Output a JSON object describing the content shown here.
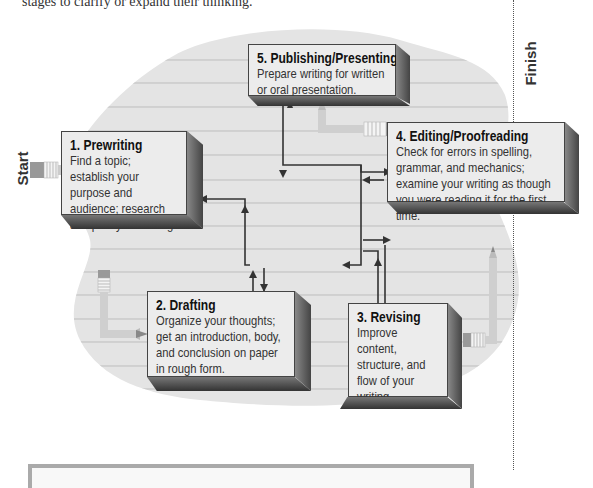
{
  "header": {
    "partial_text": "stages to clarify or expand their thinking."
  },
  "labels": {
    "start": "Start",
    "finish": "Finish"
  },
  "steps": [
    {
      "number": "1.",
      "title": "Prewriting",
      "description": "Find a topic; establish your purpose and audience; research and plan your writing."
    },
    {
      "number": "2.",
      "title": "Drafting",
      "description": "Organize your thoughts; get an introduction, body, and conclusion on paper in rough form."
    },
    {
      "number": "3.",
      "title": "Revising",
      "description": "Improve content, structure, and flow of your writing."
    },
    {
      "number": "4.",
      "title": "Editing/Proofreading",
      "description": "Check for errors in spelling, grammar, and mechanics; examine your writing as though you were reading it for the first time."
    },
    {
      "number": "5.",
      "title": "Publishing/Presenting",
      "description": "Prepare writing for written or oral presentation."
    }
  ],
  "colors": {
    "blob": "#e3e3e3",
    "lines": "#c9c9c9",
    "box_face": "#ececec",
    "arrow": "#333333",
    "pencil": "#cfcfcf"
  }
}
